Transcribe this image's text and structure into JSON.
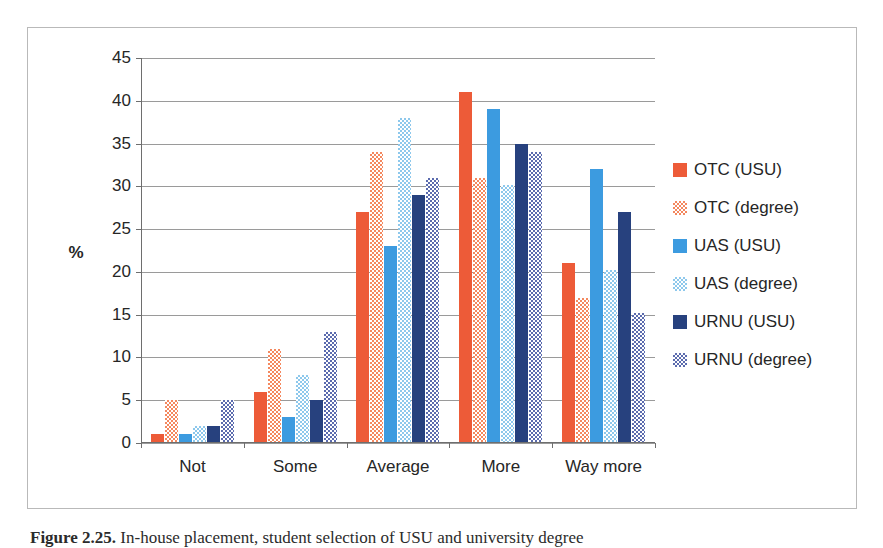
{
  "chart_data": {
    "type": "bar",
    "title": "",
    "xlabel": "",
    "ylabel": "%",
    "ylim": [
      0,
      45
    ],
    "ytick_step": 5,
    "yticks": [
      0,
      5,
      10,
      15,
      20,
      25,
      30,
      35,
      40,
      45
    ],
    "grid": true,
    "legend_position": "right",
    "categories": [
      "Not",
      "Some",
      "Average",
      "More",
      "Way more"
    ],
    "series": [
      {
        "name": "OTC (USU)",
        "color": "#ED5B38",
        "pattern": "solid",
        "values": [
          1,
          6,
          27,
          41,
          21
        ]
      },
      {
        "name": "OTC (degree)",
        "color": "#F4885F",
        "pattern": "dotted",
        "values": [
          5,
          11,
          34,
          31,
          17
        ]
      },
      {
        "name": "UAS (USU)",
        "color": "#3C9BE0",
        "pattern": "solid",
        "values": [
          1,
          3,
          23,
          39,
          32
        ]
      },
      {
        "name": "UAS (degree)",
        "color": "#8DC8EC",
        "pattern": "dotted",
        "values": [
          2,
          8,
          38,
          30.2,
          20.2
        ]
      },
      {
        "name": "URNU (USU)",
        "color": "#27417E",
        "pattern": "solid",
        "values": [
          2,
          5,
          29,
          35,
          27
        ]
      },
      {
        "name": "URNU (degree)",
        "color": "#5B6BAE",
        "pattern": "dotted",
        "values": [
          5,
          13,
          31,
          34,
          15.2
        ]
      }
    ]
  },
  "caption": {
    "number": "Figure 2.25.",
    "text": "In-house placement, student selection of USU and university degree"
  }
}
